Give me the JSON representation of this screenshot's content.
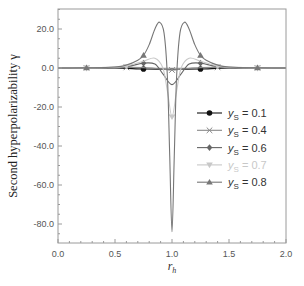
{
  "chart_data": {
    "type": "line",
    "title": "",
    "xlabel": "r_h",
    "xlabel_main": "r",
    "xlabel_sub": "h",
    "ylabel": "Second hyperpolarizability γ",
    "xlim": [
      0.0,
      2.0
    ],
    "ylim": [
      -90,
      30
    ],
    "grid": false,
    "legend_position": "center right",
    "x_ticks": [
      0.0,
      0.5,
      1.0,
      1.5,
      2.0
    ],
    "x_tick_labels": [
      "0.0",
      "0.5",
      "1.0",
      "1.5",
      "2.0"
    ],
    "y_ticks": [
      20,
      0,
      -20,
      -40,
      -60,
      -80
    ],
    "y_tick_labels": [
      "20.0",
      "0.0",
      "-20.0",
      "-40.0",
      "-60.0",
      "-80.0"
    ],
    "series": [
      {
        "name": "yS = 0.1",
        "label_main": "y",
        "label_sub": "S",
        "label_value": " = 0.1",
        "marker": "circle",
        "color": "#111111",
        "x": [
          0.0,
          0.25,
          0.5,
          0.75,
          0.9,
          1.0,
          1.1,
          1.25,
          1.5,
          1.75,
          2.0
        ],
        "y": [
          0.0,
          0.0,
          0.0,
          -0.5,
          -0.6,
          -0.6,
          -0.6,
          -0.5,
          0.0,
          0.0,
          0.0
        ],
        "marker_x": [
          0.75,
          1.25
        ]
      },
      {
        "name": "yS = 0.4",
        "label_main": "y",
        "label_sub": "S",
        "label_value": " = 0.4",
        "marker": "x",
        "color": "#888888",
        "x": [
          0.0,
          0.25,
          0.5,
          0.6,
          0.75,
          0.9,
          1.0,
          1.1,
          1.25,
          1.4,
          1.5,
          1.75,
          2.0
        ],
        "y": [
          0.0,
          0.0,
          0.2,
          0.3,
          0.2,
          -0.5,
          -1.0,
          -0.5,
          0.2,
          0.3,
          0.2,
          0.0,
          0.0
        ],
        "marker_x": [
          0.25,
          0.6,
          1.0,
          1.4,
          1.75
        ]
      },
      {
        "name": "yS = 0.6",
        "label_main": "y",
        "label_sub": "S",
        "label_value": " = 0.6",
        "marker": "diamond",
        "color": "#666666",
        "x": [
          0.0,
          0.25,
          0.5,
          0.6,
          0.75,
          0.85,
          0.92,
          1.0,
          1.08,
          1.15,
          1.25,
          1.4,
          1.5,
          1.75,
          2.0
        ],
        "y": [
          0.0,
          0.0,
          0.3,
          0.6,
          2.5,
          2.0,
          -3.0,
          -8.5,
          -3.0,
          2.0,
          2.5,
          0.6,
          0.3,
          0.0,
          0.0
        ],
        "marker_x": [
          0.25,
          0.75,
          1.25,
          1.75
        ]
      },
      {
        "name": "yS = 0.7",
        "label_main": "y",
        "label_sub": "S",
        "label_value": " = 0.7",
        "marker": "triangle-down",
        "color": "#c8c8c8",
        "x": [
          0.0,
          0.25,
          0.5,
          0.6,
          0.75,
          0.85,
          0.92,
          0.96,
          1.0,
          1.04,
          1.08,
          1.15,
          1.25,
          1.4,
          1.5,
          1.75,
          2.0
        ],
        "y": [
          0.0,
          0.0,
          0.4,
          0.9,
          3.5,
          5.0,
          0.0,
          -12.0,
          -25.0,
          -12.0,
          0.0,
          5.0,
          3.5,
          0.9,
          0.4,
          0.0,
          0.0
        ],
        "marker_x": [
          0.25,
          0.6,
          1.0,
          1.4,
          1.75
        ]
      },
      {
        "name": "yS = 0.8",
        "label_main": "y",
        "label_sub": "S",
        "label_value": " = 0.8",
        "marker": "triangle-up",
        "color": "#777777",
        "x": [
          0.0,
          0.25,
          0.5,
          0.6,
          0.7,
          0.75,
          0.8,
          0.85,
          0.89,
          0.93,
          0.96,
          0.98,
          1.0,
          1.02,
          1.04,
          1.07,
          1.11,
          1.15,
          1.2,
          1.25,
          1.3,
          1.4,
          1.5,
          1.75,
          2.0
        ],
        "y": [
          0.0,
          0.1,
          0.5,
          1.5,
          4.0,
          6.5,
          12.0,
          20.0,
          23.5,
          18.0,
          -5.0,
          -45.0,
          -84.0,
          -45.0,
          -5.0,
          18.0,
          23.5,
          20.0,
          12.0,
          6.5,
          4.0,
          1.5,
          0.5,
          0.1,
          0.0
        ],
        "marker_x": [
          0.25,
          0.75,
          1.25,
          1.75
        ]
      }
    ]
  }
}
